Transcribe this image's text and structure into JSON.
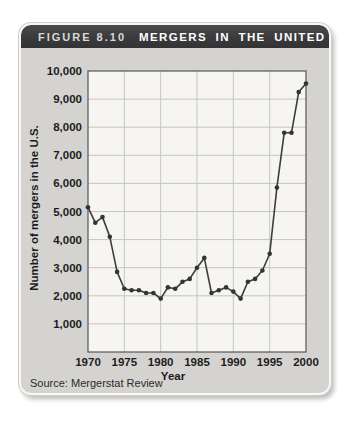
{
  "figure": {
    "label": "FIGURE 8.10",
    "title": "MERGERS IN THE UNITED STATES",
    "source": "Source: Mergerstat Review"
  },
  "colors": {
    "header_bg": "#3a3a3c",
    "header_label_text": "#d9d9d9",
    "header_title_text": "#ffffff",
    "card_bg": "#d4d3d0",
    "card_border": "#f8f7f4",
    "plot_bg": "#f6f5f2",
    "grid_line": "#c5c6c3",
    "plot_border": "#55565a",
    "data_line": "#3c3c3e",
    "marker_fill": "#343436",
    "text": "#1c1c1e"
  },
  "chart_data": {
    "type": "line",
    "title": "MERGERS IN THE UNITED STATES",
    "xlabel": "Year",
    "ylabel": "Number of mergers in the U.S.",
    "source": "Source: Mergerstat Review",
    "series_name": "Number of mergers in the U.S.",
    "x": [
      1970,
      1971,
      1972,
      1973,
      1974,
      1975,
      1976,
      1977,
      1978,
      1979,
      1980,
      1981,
      1982,
      1983,
      1984,
      1985,
      1986,
      1987,
      1988,
      1989,
      1990,
      1991,
      1992,
      1993,
      1994,
      1995,
      1996,
      1997,
      1998,
      1999,
      2000
    ],
    "values": [
      5150,
      4600,
      4800,
      4100,
      2850,
      2250,
      2200,
      2200,
      2100,
      2100,
      1900,
      2300,
      2250,
      2500,
      2600,
      3000,
      3350,
      2100,
      2200,
      2300,
      2150,
      1900,
      2500,
      2600,
      2900,
      3500,
      5850,
      7800,
      7800,
      9250,
      9550
    ],
    "xlim": [
      1970,
      2000
    ],
    "ylim": [
      0,
      10000
    ],
    "xticks": [
      1970,
      1975,
      1980,
      1985,
      1990,
      1995,
      2000
    ],
    "xtick_labels": [
      "1970",
      "1975",
      "1980",
      "1985",
      "1990",
      "1995",
      "2000"
    ],
    "yticks": [
      1000,
      2000,
      3000,
      4000,
      5000,
      6000,
      7000,
      8000,
      9000,
      10000
    ],
    "ytick_labels": [
      "1,000",
      "2,000",
      "3,000",
      "4,000",
      "5,000",
      "6,000",
      "7,000",
      "8,000",
      "9,000",
      "10,000"
    ],
    "grid": true,
    "legend": "none",
    "marker": "circle"
  }
}
